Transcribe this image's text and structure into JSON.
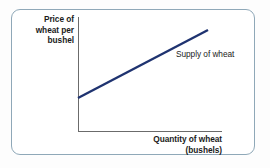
{
  "figure": {
    "title": "",
    "frame_color": "#8fa8b8",
    "background_color": "#ffffff",
    "axis_color": "#6b6b6b",
    "curve_color": "#1f3370"
  },
  "labels": {
    "y_axis_line1": "Price of",
    "y_axis_line2": "wheat per",
    "y_axis_line3": "bushel",
    "x_axis_line1": "Quantity of wheat",
    "x_axis_line2": "(bushels)",
    "curve_label": "Supply of wheat"
  },
  "chart_data": {
    "type": "line",
    "title": "",
    "xlabel": "Quantity of wheat (bushels)",
    "ylabel": "Price of wheat per bushel",
    "grid": false,
    "legend_position": "inline-annotation",
    "axis_ticks": {
      "x": [],
      "y": []
    },
    "xlim": [
      0,
      100
    ],
    "ylim": [
      0,
      100
    ],
    "annotations": [
      {
        "text": "Supply of wheat",
        "x": 68,
        "y": 71
      }
    ],
    "series": [
      {
        "name": "Supply of wheat",
        "color": "#1f3370",
        "line_width": 2.4,
        "x": [
          0,
          100
        ],
        "y": [
          29,
          89
        ],
        "points_px": [
          {
            "x": 78,
            "y": 98
          },
          {
            "x": 208,
            "y": 30
          }
        ]
      }
    ]
  }
}
